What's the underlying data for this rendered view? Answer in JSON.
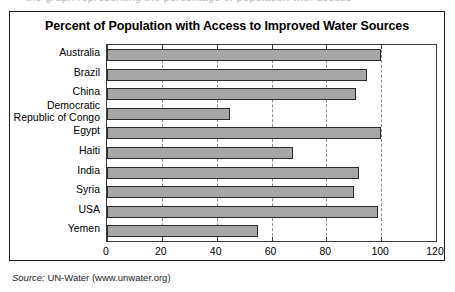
{
  "top_bleed_text": "the graph representing the percentage of population with access",
  "source": {
    "prefix": "Source:",
    "text": " UN-Water (www.unwater.org)"
  },
  "chart_data": {
    "type": "bar",
    "orientation": "horizontal",
    "title": "Percent of Population with Access to Improved Water Sources",
    "xlabel": "",
    "ylabel": "",
    "xlim": [
      0,
      120
    ],
    "xticks": [
      0,
      20,
      40,
      60,
      80,
      100,
      120
    ],
    "xtick_labels": [
      "0",
      "20",
      "40",
      "60",
      "80",
      "100",
      "120"
    ],
    "grid": "vertical-dashed",
    "legend": "none",
    "bar_color": "#a6a6a6",
    "bar_edge_color": "#2b2b2b",
    "categories": [
      "Australia",
      "Brazil",
      "China",
      "Democratic Republic of Congo",
      "Egypt",
      "Haiti",
      "India",
      "Syria",
      "USA",
      "Yemen"
    ],
    "category_label_lines": [
      [
        "Australia"
      ],
      [
        "Brazil"
      ],
      [
        "China"
      ],
      [
        "Democratic",
        "Republic of Congo"
      ],
      [
        "Egypt"
      ],
      [
        "Haiti"
      ],
      [
        "India"
      ],
      [
        "Syria"
      ],
      [
        "USA"
      ],
      [
        "Yemen"
      ]
    ],
    "values": [
      100,
      95,
      91,
      45,
      100,
      68,
      92,
      90,
      99,
      55
    ]
  }
}
